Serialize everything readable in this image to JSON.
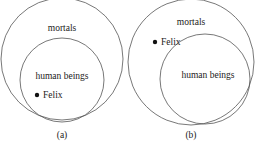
{
  "diagrams": [
    {
      "id": "a",
      "caption": "(a)",
      "outer_label": "mortals",
      "inner_label": "human beings",
      "point_label": "Felix",
      "point_location": "inside human beings"
    },
    {
      "id": "b",
      "caption": "(b)",
      "outer_label": "mortals",
      "inner_label": "human beings",
      "point_label": "Felix",
      "point_location": "inside mortals, outside human beings"
    }
  ],
  "colors": {
    "stroke": "#555555",
    "text": "#222222",
    "dot": "#111111"
  }
}
